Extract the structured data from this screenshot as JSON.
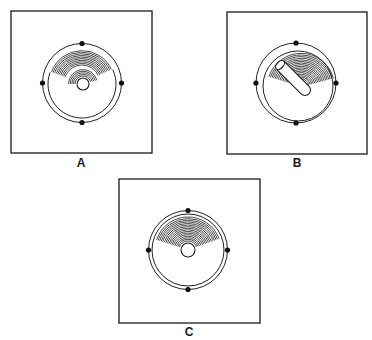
{
  "figure": {
    "panels": [
      {
        "id": "A",
        "label": "A",
        "features": [
          "square-frame",
          "outer-ring",
          "four-alignment-dots",
          "concentric-hatched-arcs",
          "central-hole"
        ]
      },
      {
        "id": "B",
        "label": "B",
        "features": [
          "square-frame",
          "outer-ring",
          "eccentric-inner-ring",
          "four-alignment-dots",
          "concentric-hatched-arcs",
          "inserted-rod"
        ]
      },
      {
        "id": "C",
        "label": "C",
        "features": [
          "square-frame",
          "double-outer-ring",
          "four-alignment-dots",
          "concentric-hatched-arcs",
          "central-hole"
        ]
      }
    ]
  },
  "colors": {
    "ink": "#1e1e1e",
    "background": "#ffffff"
  }
}
